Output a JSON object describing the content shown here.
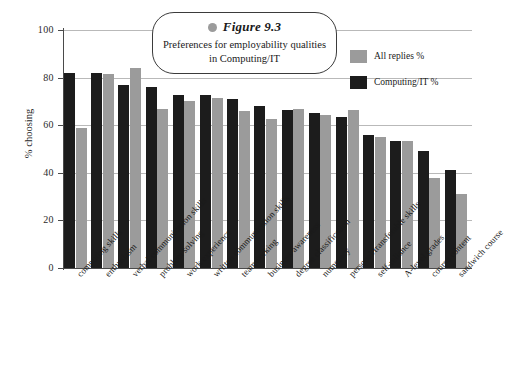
{
  "chart_data": {
    "type": "bar",
    "title": "Figure 9.3",
    "subtitle": "Preferences for employability qualities in Computing/IT",
    "xlabel": "",
    "ylabel": "% choosing",
    "ylim": [
      0,
      100
    ],
    "yticks": [
      0,
      20,
      40,
      60,
      80,
      100
    ],
    "grid": true,
    "legend_position": "top-right",
    "categories": [
      "computing skills",
      "enthusiasm",
      "verbal communication skills",
      "problem solving",
      "work experience",
      "written communication skills",
      "teamworking",
      "business awareness",
      "degree classification",
      "numeracy",
      "personal/transferable skills",
      "self-reliance",
      "A-level grades",
      "course content",
      "sandwich course"
    ],
    "series": [
      {
        "name": "Computing/IT %",
        "color": "#1c1c1c",
        "values": [
          82,
          82,
          77,
          76,
          72.5,
          72.5,
          71,
          68,
          66.5,
          65,
          63.5,
          56,
          53.5,
          49,
          41
        ]
      },
      {
        "name": "All replies %",
        "color": "#9b9b9b",
        "values": [
          59,
          81.5,
          84,
          67,
          70,
          71.5,
          66,
          62.5,
          67,
          64.5,
          66.5,
          55,
          53.5,
          38,
          31
        ]
      }
    ]
  },
  "legend": {
    "entries": [
      {
        "label": "All replies %",
        "swatch": "light"
      },
      {
        "label": "Computing/IT %",
        "swatch": "dark"
      }
    ]
  },
  "callout": {
    "figure_label": "Figure 9.3",
    "caption": "Preferences for employability qualities in Computing/IT",
    "bullet_icon": "circle-bullet-icon"
  }
}
